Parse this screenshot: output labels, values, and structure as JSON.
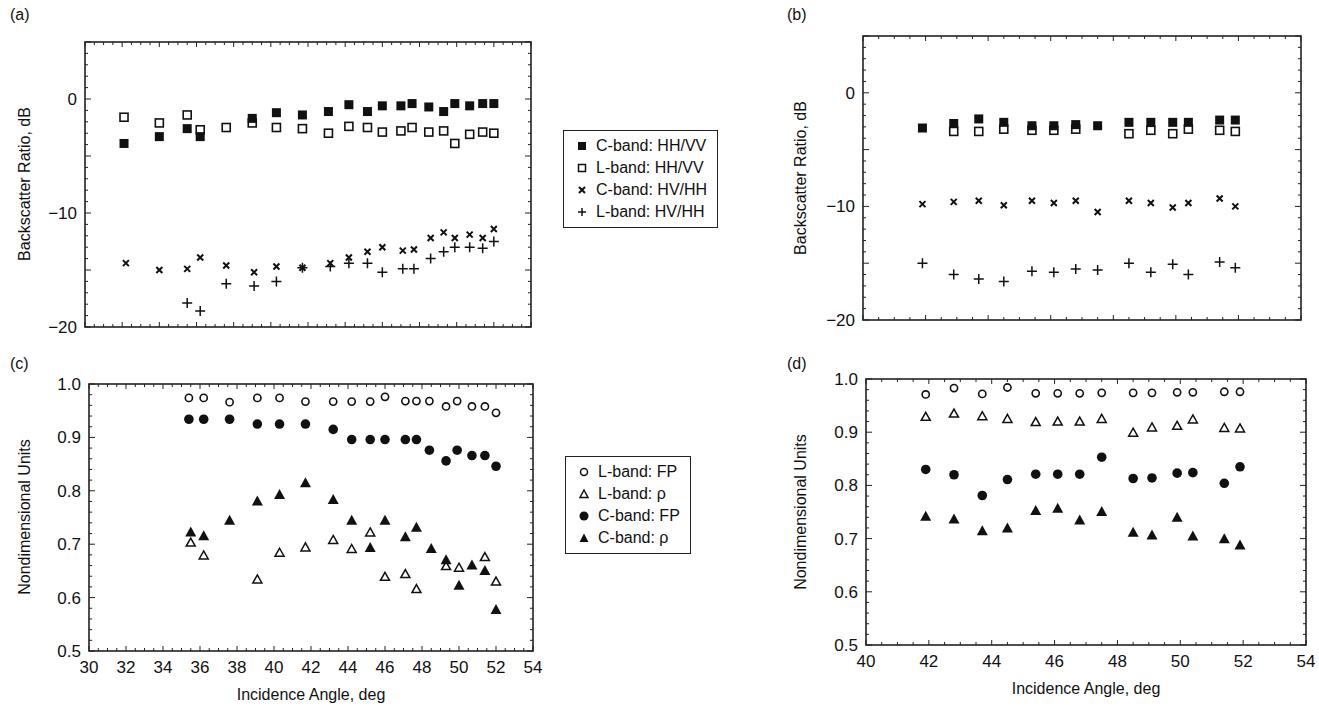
{
  "panels": {
    "a": {
      "label": "(a)"
    },
    "b": {
      "label": "(b)"
    },
    "c": {
      "label": "(c)"
    },
    "d": {
      "label": "(d)"
    }
  },
  "legend_top": {
    "items": [
      {
        "marker": "filled-square",
        "label": "C-band: HH/VV"
      },
      {
        "marker": "open-square",
        "label": "L-band: HH/VV"
      },
      {
        "marker": "x-cross",
        "label": "C-band: HV/HH"
      },
      {
        "marker": "plus",
        "label": "L-band: HV/HH"
      }
    ]
  },
  "legend_bottom": {
    "items": [
      {
        "marker": "open-circle",
        "label": "L-band: FP"
      },
      {
        "marker": "open-triangle",
        "label": "L-band: ρ"
      },
      {
        "marker": "filled-circle",
        "label": "C-band: FP"
      },
      {
        "marker": "filled-triangle",
        "label": "C-band: ρ"
      }
    ]
  },
  "chart_data": [
    {
      "id": "a",
      "type": "scatter",
      "title": "(a)",
      "xlabel": "",
      "ylabel": "Backscatter Ratio, dB",
      "xlim": [
        30,
        54
      ],
      "ylim": [
        -20,
        5
      ],
      "yticks": [
        0,
        -10,
        -20
      ],
      "ytick_labels": [
        "0",
        "−10",
        "−20"
      ],
      "xticks": [],
      "grid": false,
      "legend_position": "right (shared with b)",
      "series": [
        {
          "name": "C-band: HH/VV",
          "marker": "filled-square",
          "x": [
            32.1,
            34.0,
            35.5,
            36.2,
            39.0,
            40.3,
            41.7,
            43.1,
            44.2,
            45.2,
            46.0,
            47.0,
            47.6,
            48.5,
            49.3,
            49.9,
            50.7,
            51.4,
            52.0
          ],
          "y": [
            -3.9,
            -3.3,
            -2.6,
            -3.3,
            -1.7,
            -1.2,
            -1.4,
            -1.1,
            -0.5,
            -1.1,
            -0.6,
            -0.6,
            -0.4,
            -0.7,
            -1.1,
            -0.4,
            -0.6,
            -0.4,
            -0.4
          ]
        },
        {
          "name": "L-band: HH/VV",
          "marker": "open-square",
          "x": [
            32.1,
            34.0,
            35.5,
            36.2,
            37.6,
            39.0,
            40.3,
            41.7,
            43.1,
            44.2,
            45.2,
            46.0,
            47.0,
            47.6,
            48.5,
            49.3,
            49.9,
            50.7,
            51.4,
            52.0
          ],
          "y": [
            -1.6,
            -2.1,
            -1.4,
            -2.7,
            -2.5,
            -2.1,
            -2.5,
            -2.6,
            -3.0,
            -2.4,
            -2.5,
            -2.9,
            -2.8,
            -2.5,
            -2.9,
            -2.8,
            -3.9,
            -3.1,
            -2.9,
            -3.0
          ]
        },
        {
          "name": "C-band: HV/HH",
          "marker": "x-cross",
          "x": [
            32.2,
            34.0,
            35.5,
            36.2,
            37.6,
            39.1,
            40.3,
            41.7,
            43.2,
            44.2,
            45.2,
            46.0,
            47.1,
            47.7,
            48.6,
            49.3,
            49.9,
            50.7,
            51.4,
            52.0
          ],
          "y": [
            -14.4,
            -15.0,
            -14.9,
            -13.9,
            -14.6,
            -15.2,
            -14.7,
            -14.8,
            -14.4,
            -13.9,
            -13.4,
            -13.0,
            -13.3,
            -13.2,
            -12.2,
            -11.7,
            -12.2,
            -11.9,
            -12.2,
            -11.4
          ]
        },
        {
          "name": "L-band: HV/HH",
          "marker": "plus",
          "x": [
            35.5,
            36.2,
            37.6,
            39.1,
            40.3,
            41.7,
            43.2,
            44.2,
            45.2,
            46.0,
            47.1,
            47.7,
            48.6,
            49.3,
            49.9,
            50.7,
            51.4,
            52.0
          ],
          "y": [
            -17.9,
            -18.6,
            -16.2,
            -16.4,
            -16.0,
            -14.8,
            -14.7,
            -14.4,
            -14.4,
            -15.2,
            -14.9,
            -14.9,
            -14.0,
            -13.4,
            -13.0,
            -13.0,
            -13.1,
            -12.5
          ]
        }
      ]
    },
    {
      "id": "b",
      "type": "scatter",
      "title": "(b)",
      "xlabel": "",
      "ylabel": "Backscatter Ratio, dB",
      "xlim": [
        40,
        54
      ],
      "ylim": [
        -20,
        5
      ],
      "yticks": [
        0,
        -10,
        -20
      ],
      "ytick_labels": [
        "0",
        "−10",
        "−20"
      ],
      "xticks": [],
      "grid": false,
      "series": [
        {
          "name": "C-band: HH/VV",
          "marker": "filled-square",
          "x": [
            41.9,
            42.9,
            43.7,
            44.5,
            45.4,
            46.1,
            46.8,
            47.5,
            48.5,
            49.2,
            49.9,
            50.4,
            51.4,
            51.9
          ],
          "y": [
            -3.1,
            -2.7,
            -2.3,
            -2.6,
            -2.9,
            -2.9,
            -2.8,
            -2.9,
            -2.6,
            -2.6,
            -2.6,
            -2.6,
            -2.4,
            -2.4
          ]
        },
        {
          "name": "L-band: HH/VV",
          "marker": "open-square",
          "x": [
            42.9,
            43.7,
            44.5,
            45.4,
            46.1,
            46.8,
            48.5,
            49.2,
            49.9,
            50.4,
            51.4,
            51.9
          ],
          "y": [
            -3.4,
            -3.4,
            -3.2,
            -3.3,
            -3.3,
            -3.2,
            -3.6,
            -3.3,
            -3.6,
            -3.2,
            -3.3,
            -3.4
          ]
        },
        {
          "name": "C-band: HV/HH",
          "marker": "x-cross",
          "x": [
            41.9,
            42.9,
            43.7,
            44.5,
            45.4,
            46.1,
            46.8,
            47.5,
            48.5,
            49.2,
            49.9,
            50.4,
            51.4,
            51.9
          ],
          "y": [
            -9.8,
            -9.6,
            -9.5,
            -9.9,
            -9.5,
            -9.7,
            -9.5,
            -10.5,
            -9.5,
            -9.7,
            -10.1,
            -9.7,
            -9.3,
            -10.0
          ]
        },
        {
          "name": "L-band: HV/HH",
          "marker": "plus",
          "x": [
            41.9,
            42.9,
            43.7,
            44.5,
            45.4,
            46.1,
            46.8,
            47.5,
            48.5,
            49.2,
            49.9,
            50.4,
            51.4,
            51.9
          ],
          "y": [
            -15.0,
            -16.0,
            -16.4,
            -16.6,
            -15.7,
            -15.8,
            -15.5,
            -15.6,
            -15.0,
            -15.8,
            -15.1,
            -16.0,
            -14.9,
            -15.4
          ]
        }
      ]
    },
    {
      "id": "c",
      "type": "scatter",
      "title": "(c)",
      "xlabel": "Incidence Angle, deg",
      "ylabel": "Nondimensional Units",
      "xlim": [
        30,
        54
      ],
      "ylim": [
        0.5,
        1.0
      ],
      "xticks": [
        30,
        32,
        34,
        36,
        38,
        40,
        42,
        44,
        46,
        48,
        50,
        52,
        54
      ],
      "xtick_labels": [
        "30",
        "32",
        "34",
        "36",
        "38",
        "40",
        "42",
        "44",
        "46",
        "48",
        "50",
        "52",
        "54"
      ],
      "yticks": [
        0.5,
        0.6,
        0.7,
        0.8,
        0.9,
        1.0
      ],
      "ytick_labels": [
        "0.5",
        "0.6",
        "0.7",
        "0.8",
        "0.9",
        "1.0"
      ],
      "grid": false,
      "legend_position": "right (shared with d)",
      "series": [
        {
          "name": "L-band: FP",
          "marker": "open-circle",
          "x": [
            35.4,
            36.2,
            37.6,
            39.1,
            40.3,
            41.7,
            43.2,
            44.2,
            45.2,
            46.0,
            47.1,
            47.7,
            48.4,
            49.3,
            49.9,
            50.7,
            51.4,
            52.0
          ],
          "y": [
            0.974,
            0.974,
            0.966,
            0.974,
            0.974,
            0.967,
            0.967,
            0.967,
            0.967,
            0.976,
            0.968,
            0.968,
            0.968,
            0.958,
            0.968,
            0.958,
            0.958,
            0.946
          ]
        },
        {
          "name": "L-band: ρ",
          "marker": "open-triangle",
          "x": [
            35.5,
            36.2,
            39.1,
            40.3,
            41.7,
            43.2,
            44.2,
            45.2,
            46.0,
            47.1,
            47.7,
            49.3,
            50.0,
            51.4,
            52.0
          ],
          "y": [
            0.703,
            0.679,
            0.634,
            0.684,
            0.694,
            0.708,
            0.691,
            0.722,
            0.639,
            0.644,
            0.616,
            0.659,
            0.656,
            0.676,
            0.63
          ]
        },
        {
          "name": "C-band: FP",
          "marker": "filled-circle",
          "x": [
            35.4,
            36.2,
            37.6,
            39.1,
            40.3,
            41.7,
            43.2,
            44.2,
            45.2,
            46.0,
            47.1,
            47.7,
            48.4,
            49.3,
            49.9,
            50.7,
            51.4,
            52.0
          ],
          "y": [
            0.934,
            0.934,
            0.934,
            0.925,
            0.925,
            0.925,
            0.915,
            0.896,
            0.896,
            0.896,
            0.896,
            0.896,
            0.876,
            0.856,
            0.876,
            0.866,
            0.866,
            0.846
          ]
        },
        {
          "name": "C-band: ρ",
          "marker": "filled-triangle",
          "x": [
            35.5,
            36.2,
            37.6,
            39.1,
            40.3,
            41.7,
            43.2,
            44.2,
            45.2,
            46.0,
            47.1,
            47.7,
            48.5,
            49.3,
            50.0,
            50.7,
            51.4,
            52.0
          ],
          "y": [
            0.722,
            0.715,
            0.744,
            0.78,
            0.792,
            0.814,
            0.783,
            0.744,
            0.693,
            0.744,
            0.713,
            0.731,
            0.691,
            0.67,
            0.622,
            0.66,
            0.65,
            0.577
          ]
        }
      ]
    },
    {
      "id": "d",
      "type": "scatter",
      "title": "(d)",
      "xlabel": "Incidence Angle, deg",
      "ylabel": "Nondimensional Units",
      "xlim": [
        40,
        54
      ],
      "ylim": [
        0.5,
        1.0
      ],
      "xticks": [
        40,
        42,
        44,
        46,
        48,
        50,
        52,
        54
      ],
      "xtick_labels": [
        "40",
        "42",
        "44",
        "46",
        "48",
        "50",
        "52",
        "54"
      ],
      "yticks": [
        0.5,
        0.6,
        0.7,
        0.8,
        0.9,
        1.0
      ],
      "ytick_labels": [
        "0.5",
        "0.6",
        "0.7",
        "0.8",
        "0.9",
        "1.0"
      ],
      "grid": false,
      "series": [
        {
          "name": "L-band: FP",
          "marker": "open-circle",
          "x": [
            41.9,
            42.8,
            43.7,
            44.5,
            45.4,
            46.1,
            46.8,
            47.5,
            48.5,
            49.1,
            49.9,
            50.4,
            51.4,
            51.9
          ],
          "y": [
            0.971,
            0.983,
            0.972,
            0.984,
            0.973,
            0.973,
            0.973,
            0.974,
            0.974,
            0.974,
            0.975,
            0.975,
            0.976,
            0.976
          ]
        },
        {
          "name": "L-band: ρ",
          "marker": "open-triangle",
          "x": [
            41.9,
            42.8,
            43.7,
            44.5,
            45.4,
            46.1,
            46.8,
            47.5,
            48.5,
            49.1,
            49.9,
            50.4,
            51.4,
            51.9
          ],
          "y": [
            0.929,
            0.935,
            0.93,
            0.925,
            0.919,
            0.92,
            0.92,
            0.925,
            0.899,
            0.909,
            0.912,
            0.924,
            0.908,
            0.907
          ]
        },
        {
          "name": "C-band: FP",
          "marker": "filled-circle",
          "x": [
            41.9,
            42.8,
            43.7,
            44.5,
            45.4,
            46.1,
            46.8,
            47.5,
            48.5,
            49.1,
            49.9,
            50.4,
            51.4,
            51.9
          ],
          "y": [
            0.83,
            0.82,
            0.781,
            0.811,
            0.821,
            0.821,
            0.821,
            0.853,
            0.813,
            0.814,
            0.823,
            0.824,
            0.804,
            0.835
          ]
        },
        {
          "name": "C-band: ρ",
          "marker": "filled-triangle",
          "x": [
            41.9,
            42.8,
            43.7,
            44.5,
            45.4,
            46.1,
            46.8,
            47.5,
            48.5,
            49.1,
            49.9,
            50.4,
            51.4,
            51.9
          ],
          "y": [
            0.741,
            0.736,
            0.714,
            0.719,
            0.752,
            0.756,
            0.734,
            0.75,
            0.711,
            0.706,
            0.739,
            0.704,
            0.699,
            0.687
          ]
        }
      ]
    }
  ]
}
